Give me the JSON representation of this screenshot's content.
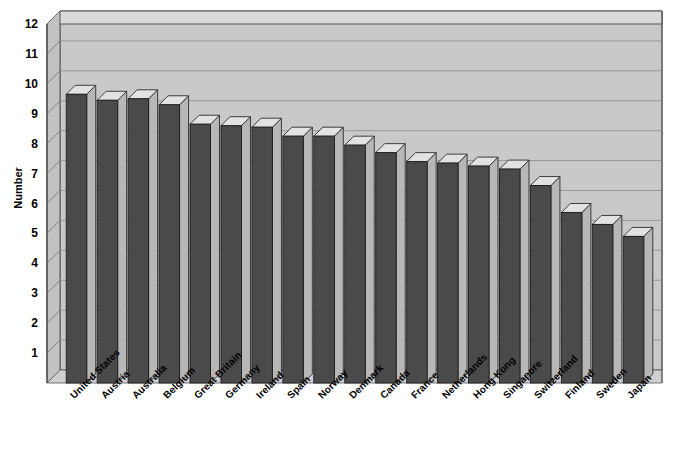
{
  "chart": {
    "title": "",
    "y_axis_title": "Number",
    "x_axis_title": ""
  },
  "chart_data": {
    "type": "bar",
    "title": "",
    "subtitle": "",
    "xlabel": "",
    "ylabel": "Number",
    "ylim": [
      0,
      12
    ],
    "yticks": [
      1,
      2,
      3,
      4,
      5,
      6,
      7,
      8,
      9,
      10,
      11,
      12
    ],
    "grid": true,
    "legend": "none",
    "style": "3d-bar",
    "bar_color": "#4a4a4a",
    "plot_background": "#c9c9c9",
    "categories": [
      "United States",
      "Austria",
      "Australia",
      "Belgium",
      "Great Britain",
      "Germany",
      "Ireland",
      "Spain",
      "Norway",
      "Denmark",
      "Canada",
      "France",
      "Netherlands",
      "Hong Kong",
      "Singapore",
      "Switzerland",
      "Finland",
      "Sweden",
      "Japan"
    ],
    "values": [
      9.65,
      9.45,
      9.5,
      9.3,
      8.65,
      8.6,
      8.55,
      8.25,
      8.25,
      7.95,
      7.7,
      7.4,
      7.35,
      7.25,
      7.15,
      6.6,
      5.7,
      5.3,
      4.9
    ]
  }
}
